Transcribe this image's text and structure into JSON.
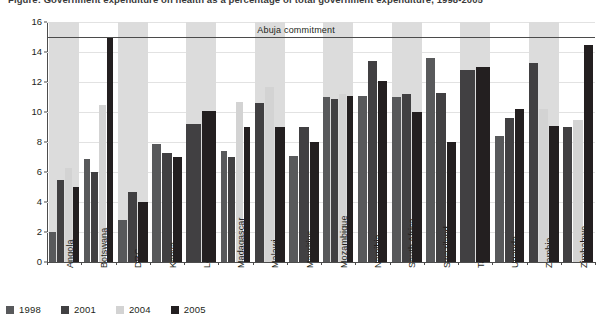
{
  "figure": {
    "title": "Figure: Government expenditure on health as a percentage of total government expenditure, 1998-2005",
    "y_axis_label": "Percentage",
    "reference_line_label": "Abuja commitment"
  },
  "legend": {
    "items": [
      {
        "label": "1998",
        "color": "#58595b"
      },
      {
        "label": "2001",
        "color": "#414042"
      },
      {
        "label": "2004",
        "color": "#d3d3d3"
      },
      {
        "label": "2005",
        "color": "#231f20"
      }
    ]
  },
  "chart_data": {
    "type": "bar",
    "title": "Government expenditure on health as a percentage of total government expenditure",
    "xlabel": "",
    "ylabel": "Percentage",
    "ylim": [
      0,
      16
    ],
    "yticks": [
      0,
      2,
      4,
      6,
      8,
      10,
      12,
      14,
      16
    ],
    "grid": true,
    "legend_position": "bottom-left",
    "reference_lines": [
      {
        "label": "Abuja commitment",
        "value": 15
      }
    ],
    "categories": [
      "Angola",
      "Botswana",
      "DRC",
      "Kenya",
      "Lesotho",
      "Madagascar",
      "Malawi",
      "Mauritius",
      "Mozambique",
      "Namibia",
      "South Africa",
      "Swaziland",
      "Tanzania",
      "Uganda",
      "Zambia",
      "Zimbabwe"
    ],
    "series": [
      {
        "name": "1998",
        "color": "#58595b",
        "values": [
          2.0,
          6.9,
          2.8,
          7.9,
          null,
          7.4,
          null,
          7.1,
          11.0,
          11.1,
          11.0,
          13.6,
          null,
          8.4,
          null,
          null
        ]
      },
      {
        "name": "2001",
        "color": "#414042",
        "values": [
          5.5,
          6.0,
          4.7,
          7.3,
          9.2,
          7.0,
          10.6,
          9.0,
          10.9,
          13.4,
          11.2,
          11.3,
          12.8,
          9.6,
          13.3,
          9.0
        ]
      },
      {
        "name": "2004",
        "color": "#d3d3d3",
        "values": [
          6.3,
          10.5,
          null,
          null,
          null,
          10.7,
          11.7,
          null,
          11.2,
          null,
          null,
          null,
          null,
          null,
          10.2,
          9.5
        ]
      },
      {
        "name": "2005",
        "color": "#231f20",
        "values": [
          5.0,
          15.0,
          4.0,
          7.0,
          10.1,
          9.0,
          9.0,
          8.0,
          11.1,
          12.1,
          10.0,
          8.0,
          13.0,
          10.2,
          9.1,
          14.5
        ]
      }
    ]
  }
}
